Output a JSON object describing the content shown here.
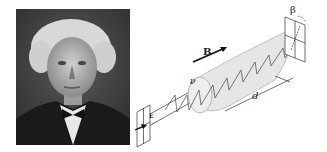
{
  "portrait": {
    "description": "black-and-white photographic portrait of an elderly man with white hair, dark coat and bow tie"
  },
  "diagram": {
    "labels": {
      "magnetic_field": "B",
      "verdet": "ν",
      "length": "d",
      "rotation_angle": "β",
      "input_field": "E"
    },
    "colors": {
      "line": "#333333",
      "cylinder_fill": "#e6e6e6",
      "plate_fill": "#ffffff"
    }
  }
}
